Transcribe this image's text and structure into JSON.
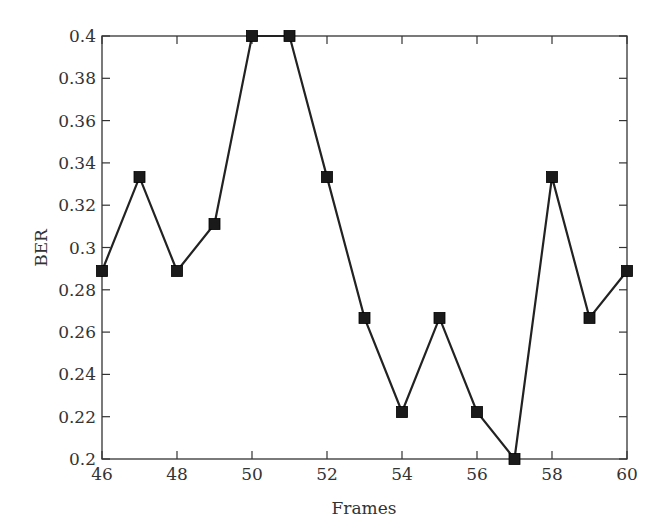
{
  "chart_data": {
    "type": "line",
    "title": "",
    "xlabel": "Frames",
    "ylabel": "BER",
    "xlim": [
      46,
      60
    ],
    "ylim": [
      0.2,
      0.4
    ],
    "xticks": [
      46,
      48,
      50,
      52,
      54,
      56,
      58,
      60
    ],
    "yticks": [
      0.2,
      0.22,
      0.24,
      0.26,
      0.28,
      0.3,
      0.32,
      0.34,
      0.36,
      0.38,
      0.4
    ],
    "ytick_labels": [
      "0.2",
      "0.22",
      "0.24",
      "0.26",
      "0.28",
      "0.3",
      "0.32",
      "0.34",
      "0.36",
      "0.38",
      "0.4"
    ],
    "grid": false,
    "legend": null,
    "series": [
      {
        "name": "BER",
        "marker": "square",
        "color": "#222222",
        "x": [
          46,
          47,
          48,
          49,
          50,
          51,
          52,
          53,
          54,
          55,
          56,
          57,
          58,
          59,
          60
        ],
        "values": [
          0.2889,
          0.3333,
          0.2889,
          0.3111,
          0.4,
          0.4,
          0.3333,
          0.2667,
          0.2222,
          0.2667,
          0.2222,
          0.2,
          0.3333,
          0.2667,
          0.2889
        ]
      }
    ]
  }
}
